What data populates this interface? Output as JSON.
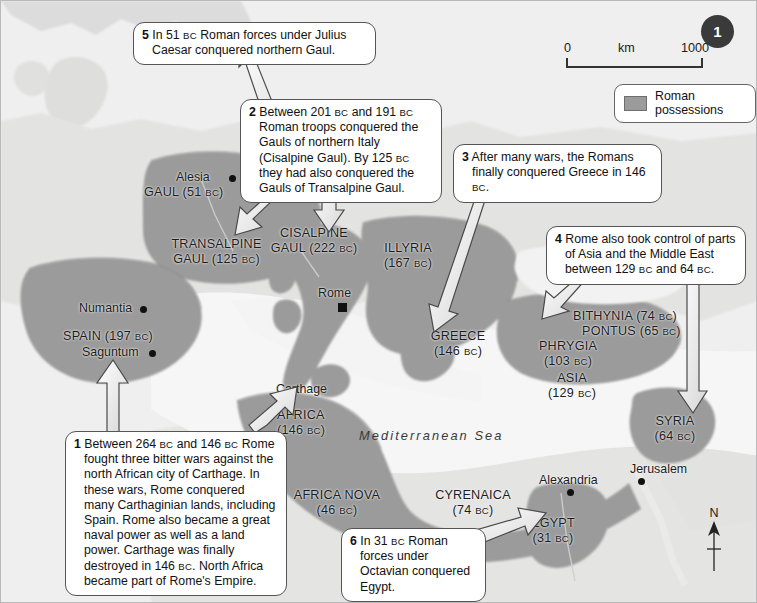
{
  "page": {
    "number": "1"
  },
  "scale": {
    "min": "0",
    "unit": "km",
    "max": "1000"
  },
  "legend": {
    "label": "Roman possessions",
    "swatch_color": "#9b9b9b"
  },
  "compass": {
    "north_label": "N"
  },
  "sea_labels": [
    {
      "name": "mediterranean-sea-label",
      "text": "Mediterranean Sea"
    }
  ],
  "callouts": [
    {
      "id": "callout-1",
      "number": "1",
      "text": "Between 264 BC and 146 BC Rome fought three bitter wars against the north African city of Carthage. In these wars, Rome conquered many Carthaginian lands, including Spain. Rome also became a great naval power as well as a land power. Carthage was finally destroyed in 146 BC. North Africa became part of Rome's Empire.",
      "lines": [
        "Between 264 BC and 146 BC Rome",
        "fought three bitter wars against the north",
        "African city of Carthage. In these wars,",
        "Rome conquered many Carthaginian",
        "lands, including Spain. Rome also",
        "became a great naval power as well as",
        "a land power. Carthage was finally",
        "destroyed in 146 BC. North Africa became",
        "part of Rome's Empire."
      ]
    },
    {
      "id": "callout-2",
      "number": "2",
      "text": "Between 201 BC and 191 BC Roman troops conquered the Gauls of northern Italy (Cisalpine Gaul). By 125 BC they had also conquered the Gauls of Transalpine Gaul.",
      "lines": [
        "Between 201 BC and 191 BC Roman",
        "troops conquered the Gauls of",
        "northern Italy (Cisalpine Gaul). By",
        "125 BC they had also conquered",
        "the Gauls of Transalpine Gaul."
      ]
    },
    {
      "id": "callout-3",
      "number": "3",
      "text": "After many wars, the Romans finally conquered Greece in 146 BC.",
      "lines": [
        "After many wars, the Romans finally",
        "conquered Greece in 146 BC."
      ]
    },
    {
      "id": "callout-4",
      "number": "4",
      "text": "Rome also took control of parts of Asia and the Middle East between 129 BC and 64 BC.",
      "lines": [
        "Rome also took control of parts",
        "of Asia and the Middle East",
        "between 129 BC and 64 BC."
      ]
    },
    {
      "id": "callout-5",
      "number": "5",
      "text": "In 51 BC Roman forces under Julius Caesar conquered northern Gaul.",
      "lines": [
        "In 51 BC Roman forces under Julius",
        "Caesar conquered northern Gaul."
      ]
    },
    {
      "id": "callout-6",
      "number": "6",
      "text": "In 31 BC Roman forces under Octavian conquered Egypt.",
      "lines": [
        "In 31 BC Roman forces",
        "under Octavian",
        "conquered Egypt."
      ]
    }
  ],
  "regions": [
    {
      "name": "gaul",
      "label": "GAUL",
      "date": "(51 BC)"
    },
    {
      "name": "transalpine-gaul",
      "label": "TRANSALPINE",
      "label2": "GAUL",
      "date": "(125 BC)"
    },
    {
      "name": "cisalpine-gaul",
      "label": "CISALPINE",
      "label2": "GAUL",
      "date": "(222 BC)"
    },
    {
      "name": "illyria",
      "label": "ILLYRIA",
      "date": "(167 BC)"
    },
    {
      "name": "spain",
      "label": "SPAIN",
      "date": "(197 BC)"
    },
    {
      "name": "greece",
      "label": "GREECE",
      "date": "(146 BC)"
    },
    {
      "name": "bithynia",
      "label": "BITHYNIA",
      "date": "(74 BC)"
    },
    {
      "name": "pontus",
      "label": "PONTUS",
      "date": "(65 BC)"
    },
    {
      "name": "phrygia",
      "label": "PHRYGIA",
      "date": "(103 BC)"
    },
    {
      "name": "asia",
      "label": "ASIA",
      "date": "(129 BC)"
    },
    {
      "name": "syria",
      "label": "SYRIA",
      "date": "(64 BC)"
    },
    {
      "name": "africa",
      "label": "AFRICA",
      "date": "(146 BC)"
    },
    {
      "name": "africa-nova",
      "label": "AFRICA NOVA",
      "date": "(46 BC)"
    },
    {
      "name": "cyrenaica",
      "label": "CYRENAICA",
      "date": "(74 BC)"
    },
    {
      "name": "egypt",
      "label": "EGYPT",
      "date": "(31 BC)"
    }
  ],
  "cities": [
    {
      "name": "alesia",
      "label": "Alesia"
    },
    {
      "name": "numantia",
      "label": "Numantia"
    },
    {
      "name": "saguntum",
      "label": "Saguntum"
    },
    {
      "name": "rome",
      "label": "Rome"
    },
    {
      "name": "carthage",
      "label": "Carthage"
    },
    {
      "name": "alexandria",
      "label": "Alexandria"
    },
    {
      "name": "jerusalem",
      "label": "Jerusalem"
    }
  ]
}
